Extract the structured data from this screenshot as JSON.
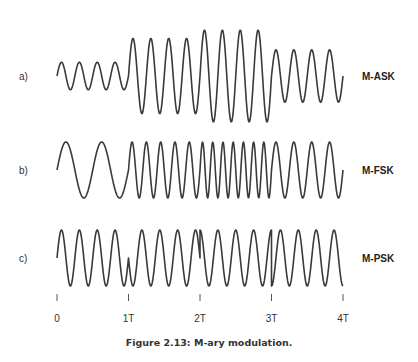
{
  "figure": {
    "caption": "Figure 2.13: M-ary modulation."
  },
  "axis": {
    "ticks": [
      {
        "label": "0",
        "t": 0
      },
      {
        "label": "1T",
        "t": 1
      },
      {
        "label": "2T",
        "t": 2
      },
      {
        "label": "3T",
        "t": 3
      },
      {
        "label": "4T",
        "t": 4
      }
    ]
  },
  "rows": [
    {
      "letter": "a)",
      "name": "M-ASK",
      "type": "ask",
      "segments": [
        {
          "cycles": 4,
          "amplitude": 0.3,
          "phase_deg": 0
        },
        {
          "cycles": 4,
          "amplitude": 0.82,
          "phase_deg": 0
        },
        {
          "cycles": 4,
          "amplitude": 1.0,
          "phase_deg": 0
        },
        {
          "cycles": 4,
          "amplitude": 0.57,
          "phase_deg": 0
        }
      ]
    },
    {
      "letter": "b)",
      "name": "M-FSK",
      "type": "fsk",
      "segments": [
        {
          "cycles": 2,
          "amplitude": 1.0,
          "phase_deg": 0
        },
        {
          "cycles": 5,
          "amplitude": 1.0,
          "phase_deg": 0
        },
        {
          "cycles": 7,
          "amplitude": 1.0,
          "phase_deg": 0
        },
        {
          "cycles": 4,
          "amplitude": 1.0,
          "phase_deg": 0
        }
      ]
    },
    {
      "letter": "c)",
      "name": "M-PSK",
      "type": "psk",
      "segments": [
        {
          "cycles": 4,
          "amplitude": 1.0,
          "phase_deg": 0
        },
        {
          "cycles": 4,
          "amplitude": 1.0,
          "phase_deg": 180
        },
        {
          "cycles": 4,
          "amplitude": 1.0,
          "phase_deg": 90
        },
        {
          "cycles": 4,
          "amplitude": 1.0,
          "phase_deg": 270
        }
      ]
    }
  ],
  "chart_data": {
    "type": "line",
    "title": "Figure 2.13: M-ary modulation.",
    "xlabel": "",
    "ylabel": "",
    "x_ticks": [
      "0",
      "1T",
      "2T",
      "3T",
      "4T"
    ],
    "xlim": [
      0,
      4
    ],
    "grid": false,
    "series": [
      {
        "name": "M-ASK",
        "cycles_per_symbol": [
          4,
          4,
          4,
          4
        ],
        "relative_amplitude": [
          0.3,
          0.82,
          1.0,
          0.57
        ]
      },
      {
        "name": "M-FSK",
        "cycles_per_symbol": [
          2,
          5,
          7,
          4
        ],
        "relative_amplitude": [
          1,
          1,
          1,
          1
        ]
      },
      {
        "name": "M-PSK",
        "cycles_per_symbol": [
          4,
          4,
          4,
          4
        ],
        "phase_deg": [
          0,
          180,
          90,
          270
        ]
      }
    ]
  }
}
